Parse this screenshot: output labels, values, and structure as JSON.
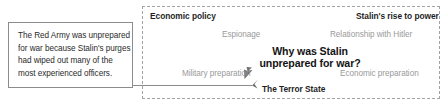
{
  "callout": {
    "lines": [
      "The Red Army was unprepared",
      "for war because Stalin's purges",
      "had wiped out many of the",
      "most experienced officers."
    ]
  },
  "diagram": {
    "center_question": {
      "line1": "Why was Stalin",
      "line2": "unprepared for war?"
    },
    "branches": [
      {
        "id": "economic-policy",
        "label": "Economic policy",
        "emphasis": "strong"
      },
      {
        "id": "stalins-rise-to-power",
        "label": "Stalin's rise to power",
        "emphasis": "strong"
      },
      {
        "id": "espionage",
        "label": "Espionage",
        "emphasis": "muted"
      },
      {
        "id": "relationship-with-hitler",
        "label": "Relationship with Hitler",
        "emphasis": "muted"
      },
      {
        "id": "military-preparation",
        "label": "Military preparation",
        "emphasis": "muted"
      },
      {
        "id": "economic-preparation",
        "label": "Economic preparation",
        "emphasis": "muted"
      },
      {
        "id": "the-terror-state",
        "label": "The Terror State",
        "emphasis": "strong"
      }
    ]
  },
  "colors": {
    "text_dark": "#1f1f1f",
    "text_muted": "#9a9a9a",
    "box_border": "#8c8c8c",
    "panel_border": "#a3a3a3",
    "connector": "#8c8c8c",
    "background": "#ffffff"
  }
}
